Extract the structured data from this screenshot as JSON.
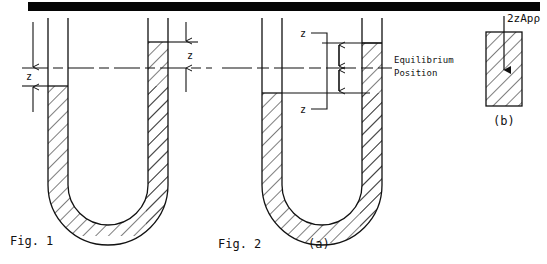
{
  "page": {
    "width": 547,
    "height": 264,
    "background": "#ffffff",
    "ink": "#111111"
  },
  "top_bar": {
    "name": "page-edge-black-bar",
    "x": 28,
    "y": 2,
    "width": 512,
    "height": 9,
    "color": "#050505"
  },
  "figure1": {
    "caption": "Fig. 1",
    "caption_x": 10,
    "caption_y": 245,
    "left_dimension_label": "z",
    "right_dimension_label": "z",
    "tube": {
      "left_outer_x": 48,
      "left_inner_x": 68,
      "right_inner_x": 148,
      "right_outer_x": 168,
      "top_y": 18,
      "bend_center_y": 185,
      "bottom_y": 232
    },
    "equilibrium_y": 68,
    "left_level_y": 86,
    "right_level_y": 42
  },
  "figure2": {
    "caption": "Fig. 2",
    "panel_a_label": "(a)",
    "panel_b_label": "(b)",
    "caption_x": 218,
    "caption_y": 248,
    "panel_a_label_x": 308,
    "panel_a_label_y": 248,
    "upper_dimension_label": "z",
    "lower_dimension_label": "z",
    "equilibrium_note_line1": "Equilibrium",
    "equilibrium_note_line2": "Position",
    "tube": {
      "left_outer_x": 262,
      "left_inner_x": 282,
      "right_inner_x": 362,
      "right_outer_x": 382,
      "top_y": 18,
      "bottom_y": 232
    },
    "equilibrium_y": 68,
    "left_level_y": 93,
    "right_level_y": 43
  },
  "panel_b": {
    "label": "(b)",
    "force_label": "2zApρ",
    "rect": {
      "x": 486,
      "y": 32,
      "width": 36,
      "height": 74
    },
    "label_x": 504,
    "label_y": 122,
    "force_label_x": 506,
    "force_label_y": 20,
    "arrow_x": 504,
    "arrow_top_y": 16,
    "arrow_bottom_y": 72
  }
}
